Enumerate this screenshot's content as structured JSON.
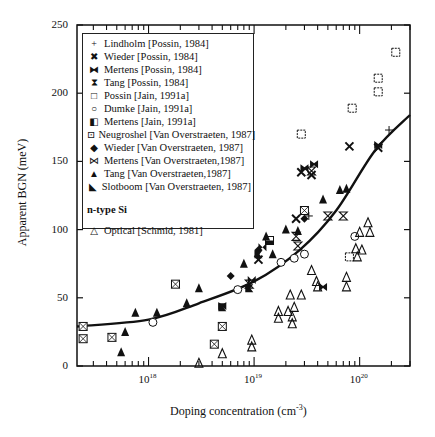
{
  "chart_data": {
    "type": "scatter",
    "title": "",
    "xlabel": "Doping concentration (cm-3)",
    "xlabel_base": "Doping concentration (cm",
    "xlabel_exp": "-3",
    "xlabel_tail": ")",
    "ylabel": "Apparent BGN (meV)",
    "xscale": "log",
    "xlim": [
      2.1e+17,
      3e+20
    ],
    "ylim": [
      0,
      250
    ],
    "yticks": [
      0,
      50,
      100,
      150,
      200,
      250
    ],
    "xticks": [
      {
        "base": "10",
        "exp": "18"
      },
      {
        "base": "10",
        "exp": "19"
      },
      {
        "base": "10",
        "exp": "20"
      }
    ],
    "grid": false,
    "legend_position": "upper-left inset",
    "legend": {
      "entries": [
        {
          "symbol": "plus",
          "glyph": "+",
          "label": "Lindholm [Possin, 1984]"
        },
        {
          "symbol": "x-cross",
          "glyph": "✖",
          "label": "Wieder [Possin, 1984]"
        },
        {
          "symbol": "filled-bowtie-box",
          "glyph": "⧓",
          "label": "Mertens [Possin, 1984]"
        },
        {
          "symbol": "hourglass",
          "glyph": "⧗",
          "label": "Tang [Possin, 1984]"
        },
        {
          "symbol": "open-square",
          "glyph": "□",
          "label": "Possin [Jain, 1991a]"
        },
        {
          "symbol": "open-circle",
          "glyph": "○",
          "label": "Dumke [Jain, 1991a]"
        },
        {
          "symbol": "half-filled-square",
          "glyph": "◧",
          "label": "Mertens [Jain, 1991a]"
        },
        {
          "symbol": "boxed-square",
          "glyph": "⊡",
          "label": "Neugroshel [Van Overstraeten, 1987]"
        },
        {
          "symbol": "filled-diamond",
          "glyph": "◆",
          "label": "Wieder [Van Overstraeten, 1987]"
        },
        {
          "symbol": "bowtie",
          "glyph": "⋈",
          "label": "Mertens [Van Overstraeten,1987]"
        },
        {
          "symbol": "filled-triangle",
          "glyph": "▲",
          "label": "Tang [Van Overstraeten,1987]"
        },
        {
          "symbol": "filled-flag",
          "glyph": "◣",
          "label": "Slotboom [Van Overstraeten, 1987]"
        }
      ],
      "subtitle": "n-type  Si",
      "optical_entry": {
        "symbol": "open-triangle",
        "glyph": "△",
        "label": "Optical [Schmid, 1981]"
      }
    },
    "series": [
      {
        "name": "Lindholm [Possin, 1984]",
        "marker": "plus",
        "points": [
          [
            1.9e+20,
            173
          ],
          [
            3.3e+19,
            110
          ]
        ]
      },
      {
        "name": "Wieder [Possin, 1984]",
        "marker": "x-cross",
        "points": [
          [
            8e+19,
            161
          ],
          [
            1.5e+20,
            160
          ],
          [
            2.8e+19,
            142
          ],
          [
            3.5e+19,
            140
          ],
          [
            2.5e+19,
            108
          ],
          [
            1.1e+19,
            78
          ]
        ]
      },
      {
        "name": "Mertens [Possin, 1984]",
        "marker": "filled-bowtie-box",
        "points": [
          [
            3e+19,
            145
          ],
          [
            3.7e+19,
            148
          ],
          [
            4.5e+19,
            58
          ],
          [
            1.5e+20,
            162
          ],
          [
            5e+18,
            44
          ]
        ]
      },
      {
        "name": "Tang [Possin, 1984]",
        "marker": "hourglass",
        "points": [
          [
            2.5e+19,
            95
          ],
          [
            2.6e+19,
            88
          ],
          [
            5e+19,
            110
          ],
          [
            7e+19,
            110
          ],
          [
            3.5e+19,
            143
          ],
          [
            9e+18,
            60
          ]
        ]
      },
      {
        "name": "Possin [Jain, 1991a]",
        "marker": "open-square",
        "points": [
          [
            2.8e+19,
            170
          ],
          [
            8.5e+19,
            189
          ],
          [
            1.5e+20,
            201
          ],
          [
            1.5e+20,
            211
          ],
          [
            2.2e+20,
            230
          ],
          [
            8e+19,
            80
          ]
        ]
      },
      {
        "name": "Dumke [Jain, 1991a]",
        "marker": "open-circle",
        "points": [
          [
            1.8e+19,
            76
          ],
          [
            2.4e+19,
            79
          ],
          [
            3e+19,
            82
          ],
          [
            9e+19,
            95
          ],
          [
            1.1e+18,
            32
          ],
          [
            7e+18,
            56
          ]
        ]
      },
      {
        "name": "Mertens [Jain, 1991a]",
        "marker": "half-filled-square",
        "points": [
          [
            1.4e+19,
            92
          ]
        ]
      },
      {
        "name": "Neugroshel [Van Overstraeten, 1987]",
        "marker": "boxed-square",
        "points": [
          [
            2.4e+17,
            29
          ],
          [
            2.4e+17,
            20
          ],
          [
            4.5e+17,
            21
          ],
          [
            1.8e+18,
            60
          ],
          [
            5e+18,
            29
          ],
          [
            4.2e+18,
            16
          ],
          [
            3e+19,
            114
          ]
        ]
      },
      {
        "name": "Wieder [Van Overstraeten, 1987]",
        "marker": "filled-diamond",
        "points": [
          [
            6e+18,
            66
          ],
          [
            1.1e+19,
            85
          ],
          [
            3e+19,
            108
          ]
        ]
      },
      {
        "name": "Mertens [Van Overstraeten,1987]",
        "marker": "bowtie",
        "points": [
          [
            1.2e+19,
            87
          ],
          [
            9.5e+18,
            63
          ]
        ]
      },
      {
        "name": "Tang [Van Overstraeten,1987]",
        "marker": "filled-triangle",
        "points": [
          [
            6e+17,
            25
          ],
          [
            5.5e+17,
            10
          ],
          [
            7.5e+17,
            39
          ],
          [
            1.2e+18,
            39
          ],
          [
            2.3e+18,
            46
          ],
          [
            3e+18,
            57
          ],
          [
            8e+18,
            75
          ],
          [
            1.3e+19,
            95
          ],
          [
            1.5e+19,
            82
          ],
          [
            2e+19,
            100
          ],
          [
            4.5e+19,
            122
          ],
          [
            6.5e+19,
            129
          ],
          [
            7.5e+19,
            130
          ],
          [
            2.6e+19,
            99
          ]
        ]
      },
      {
        "name": "Slotboom [Van Overstraeten, 1987]",
        "marker": "filled-flag",
        "points": [
          [
            5e+18,
            43
          ],
          [
            1.1e+19,
            82
          ],
          [
            9e+18,
            57
          ]
        ]
      },
      {
        "name": "Optical [Schmid, 1981]",
        "marker": "open-triangle",
        "points": [
          [
            3e+18,
            2
          ],
          [
            5e+18,
            9
          ],
          [
            9.5e+18,
            19
          ],
          [
            9.5e+18,
            14
          ],
          [
            1.7e+19,
            35
          ],
          [
            1.7e+19,
            40
          ],
          [
            2.1e+19,
            40
          ],
          [
            2.4e+19,
            43
          ],
          [
            2.2e+19,
            52
          ],
          [
            2.8e+19,
            52
          ],
          [
            4e+19,
            58
          ],
          [
            3.5e+19,
            70
          ],
          [
            3.9e+19,
            62
          ],
          [
            7.5e+19,
            58
          ],
          [
            7.5e+19,
            65
          ],
          [
            9.2e+19,
            86
          ],
          [
            9.5e+19,
            80
          ],
          [
            1.05e+20,
            85
          ],
          [
            1.2e+20,
            105
          ],
          [
            1.25e+20,
            98
          ],
          [
            1e+20,
            98
          ],
          [
            2.3e+19,
            36
          ],
          [
            2.3e+19,
            31
          ]
        ]
      }
    ],
    "curve": {
      "name": "fit",
      "points": [
        [
          2.1e+17,
          29
        ],
        [
          1e+18,
          34
        ],
        [
          3e+18,
          46
        ],
        [
          1e+19,
          62
        ],
        [
          2.7e+19,
          85
        ],
        [
          6e+19,
          114
        ],
        [
          1.4e+20,
          158
        ],
        [
          3e+20,
          184
        ]
      ]
    }
  }
}
